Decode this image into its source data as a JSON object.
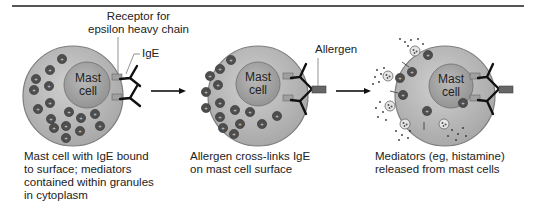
{
  "figure": {
    "labels": {
      "receptor_line1": "Receptor for",
      "receptor_line2": "epsilon heavy chain",
      "ige": "IgE",
      "allergen": "Allergen",
      "nucleus": [
        "Mast",
        "cell"
      ]
    },
    "panels": [
      {
        "id": "panel-1",
        "nucleus_text": [
          "Mast",
          "cell"
        ],
        "caption": [
          "Mast cell with IgE bound",
          "to surface; mediators",
          "contained within granules",
          "in cytoplasm"
        ]
      },
      {
        "id": "panel-2",
        "nucleus_text": [
          "Mast",
          "cell"
        ],
        "caption": [
          "Allergen cross-links IgE",
          "on mast cell surface"
        ]
      },
      {
        "id": "panel-3",
        "nucleus_text": [
          "Mast",
          "cell"
        ],
        "caption": [
          "Mediators (eg, histamine)",
          "released from mast cells"
        ]
      }
    ],
    "colors": {
      "cell_fill": "#bdbdbd",
      "cell_stroke": "#8a8a8a",
      "nucleus_fill": "#a8a8a8",
      "granule_fill": "#555555",
      "receptor_fill": "#9a9a9a",
      "antibody_stroke": "#111111",
      "allergen_fill": "#666666"
    }
  }
}
